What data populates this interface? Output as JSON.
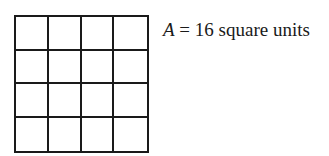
{
  "figure": {
    "grid": {
      "rows": 4,
      "cols": 4,
      "line_color": "#1a1a1a"
    },
    "label": {
      "variable": "A",
      "equals": " = ",
      "value": "16",
      "units": " square units"
    }
  }
}
